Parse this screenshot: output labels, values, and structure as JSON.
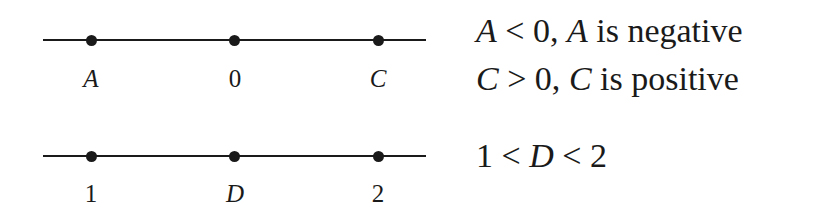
{
  "number_lines": [
    {
      "points": [
        {
          "label": "A",
          "italic": true
        },
        {
          "label": "0",
          "italic": false
        },
        {
          "label": "C",
          "italic": true
        }
      ]
    },
    {
      "points": [
        {
          "label": "1",
          "italic": false
        },
        {
          "label": "D",
          "italic": true
        },
        {
          "label": "2",
          "italic": false
        }
      ]
    }
  ],
  "statements": [
    {
      "v1": "A",
      "op": " < 0, ",
      "v2": "A",
      "rest": " is negative"
    },
    {
      "v1": "C",
      "op": " > 0, ",
      "v2": "C",
      "rest": " is positive"
    },
    {
      "pre": "1 < ",
      "v": "D",
      "post": " < 2"
    }
  ]
}
